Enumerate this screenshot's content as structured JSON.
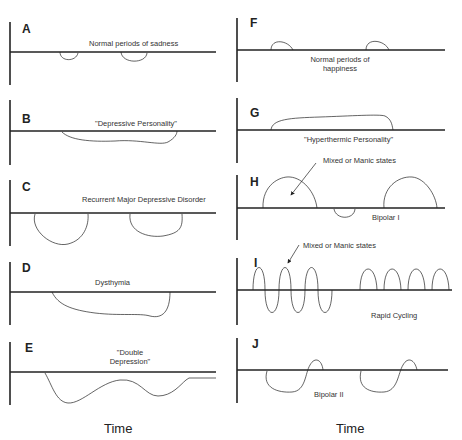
{
  "panels": {
    "A": {
      "letter": "A",
      "label": "Normal periods of sadness"
    },
    "B": {
      "letter": "B",
      "label": "\"Depressive Personality\""
    },
    "C": {
      "letter": "C",
      "label": "Recurrent Major Depressive Disorder"
    },
    "D": {
      "letter": "D",
      "label": "Dysthymia"
    },
    "E": {
      "letter": "E",
      "label_line1": "\"Double",
      "label_line2": "Depression\""
    },
    "F": {
      "letter": "F",
      "label_line1": "Normal periods of",
      "label_line2": "happiness"
    },
    "G": {
      "letter": "G",
      "label": "\"Hyperthermic Personality\""
    },
    "H": {
      "letter": "H",
      "label": "Bipolar I",
      "annotation": "Mixed or Manic states"
    },
    "I": {
      "letter": "I",
      "label": "Rapid Cycling",
      "annotation": "Mixed or Manic states"
    },
    "J": {
      "letter": "J",
      "label": "Bipolar II"
    }
  },
  "axis": {
    "x_label_left": "Time",
    "x_label_right": "Time"
  }
}
